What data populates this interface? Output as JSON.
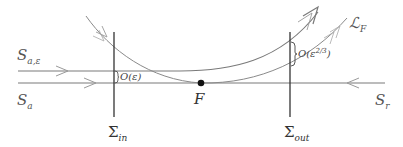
{
  "figure": {
    "type": "phase-plane schematic",
    "colors": {
      "line": "#7a7a7a",
      "section": "#333333",
      "point": "#111111",
      "text": "#555555"
    }
  },
  "labels": {
    "s_a_eps": {
      "base": "S",
      "sub": "a,ε"
    },
    "s_a": {
      "base": "S",
      "sub": "a"
    },
    "s_r": {
      "base": "S",
      "sub": "r"
    },
    "fold_point": "F",
    "l_f": {
      "base": "ℒ",
      "sub": "F"
    },
    "sigma_in": {
      "base": "Σ",
      "sub": "in"
    },
    "sigma_out": {
      "base": "Σ",
      "sub": "out"
    },
    "gap_in": "O(ε)",
    "gap_out": {
      "base": "O(ε",
      "sup": "2/3",
      "close": ")"
    }
  }
}
